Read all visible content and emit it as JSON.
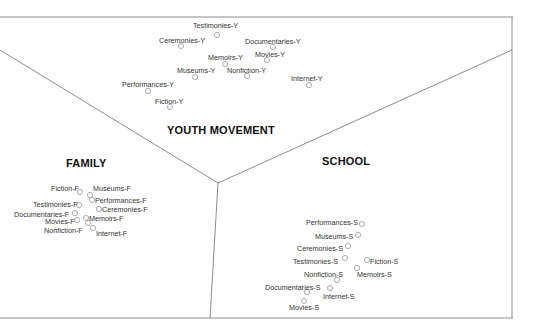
{
  "diagram": {
    "colors": {
      "line": "#6f6f6f",
      "marker": "#8a8a8a",
      "text": "#333333"
    },
    "regions": [
      {
        "id": "youth",
        "label": "YOUTH MOVEMENT",
        "x": 167,
        "y": 124
      },
      {
        "id": "family",
        "label": "FAMILY",
        "x": 66,
        "y": 157
      },
      {
        "id": "school",
        "label": "SCHOOL",
        "x": 322,
        "y": 155
      }
    ],
    "points": [
      {
        "label": "Testimonies-Y",
        "lx": 193,
        "ly": 22,
        "cx": 217,
        "cy": 35
      },
      {
        "label": "Ceremonies-Y",
        "lx": 159,
        "ly": 37,
        "cx": 181,
        "cy": 46
      },
      {
        "label": "Documentaries-Y",
        "lx": 245,
        "ly": 38,
        "cx": 273,
        "cy": 47
      },
      {
        "label": "Memoirs-Y",
        "lx": 208,
        "ly": 54,
        "cx": 225,
        "cy": 64
      },
      {
        "label": "Movies-Y",
        "lx": 255,
        "ly": 51,
        "cx": 267,
        "cy": 60
      },
      {
        "label": "Museums-Y",
        "lx": 177,
        "ly": 67,
        "cx": 195,
        "cy": 77
      },
      {
        "label": "Nonfiction-Y",
        "lx": 227,
        "ly": 67,
        "cx": 247,
        "cy": 76
      },
      {
        "label": "Internet-Y",
        "lx": 291,
        "ly": 75,
        "cx": 309,
        "cy": 85
      },
      {
        "label": "Performances-Y",
        "lx": 122,
        "ly": 81,
        "cx": 148,
        "cy": 91
      },
      {
        "label": "Fiction-Y",
        "lx": 155,
        "ly": 98,
        "cx": 170,
        "cy": 107
      },
      {
        "label": "Fiction-F",
        "lx": 51,
        "ly": 185,
        "cx": 80,
        "cy": 192
      },
      {
        "label": "Museums-F",
        "lx": 93,
        "ly": 185,
        "cx": 90,
        "cy": 195
      },
      {
        "label": "Performances-F",
        "lx": 95,
        "ly": 197,
        "cx": 92,
        "cy": 200
      },
      {
        "label": "Testimonies-F",
        "lx": 33,
        "ly": 201,
        "cx": 79,
        "cy": 205
      },
      {
        "label": "Ceremonies-F",
        "lx": 102,
        "ly": 206,
        "cx": 99,
        "cy": 209
      },
      {
        "label": "Documentaries-F",
        "lx": 14,
        "ly": 211,
        "cx": 75,
        "cy": 213
      },
      {
        "label": "Memoirs-F",
        "lx": 89,
        "ly": 215,
        "cx": 86,
        "cy": 218
      },
      {
        "label": "Movies-F",
        "lx": 45,
        "ly": 218,
        "cx": 77,
        "cy": 220
      },
      {
        "label": "Nonfiction-F",
        "lx": 44,
        "ly": 227,
        "cx": 88,
        "cy": 223
      },
      {
        "label": "Internet-F",
        "lx": 96,
        "ly": 230,
        "cx": 93,
        "cy": 228
      },
      {
        "label": "Performances-S",
        "lx": 306,
        "ly": 219,
        "cx": 362,
        "cy": 224
      },
      {
        "label": "Museums-S",
        "lx": 315,
        "ly": 233,
        "cx": 358,
        "cy": 235
      },
      {
        "label": "Ceremonies-S",
        "lx": 297,
        "ly": 245,
        "cx": 348,
        "cy": 246
      },
      {
        "label": "Testimonies-S",
        "lx": 293,
        "ly": 258,
        "cx": 345,
        "cy": 258
      },
      {
        "label": "Fiction-S",
        "lx": 370,
        "ly": 258,
        "cx": 367,
        "cy": 260
      },
      {
        "label": "Nonfiction-S",
        "lx": 304,
        "ly": 271,
        "cx": 337,
        "cy": 280
      },
      {
        "label": "Memoirs-S",
        "lx": 357,
        "ly": 271,
        "cx": 357,
        "cy": 268
      },
      {
        "label": "Documentaries-S",
        "lx": 265,
        "ly": 284,
        "cx": 307,
        "cy": 292
      },
      {
        "label": "Internet-S",
        "lx": 323,
        "ly": 293,
        "cx": 330,
        "cy": 288
      },
      {
        "label": "Movies-S",
        "lx": 289,
        "ly": 304,
        "cx": 304,
        "cy": 301
      }
    ]
  }
}
